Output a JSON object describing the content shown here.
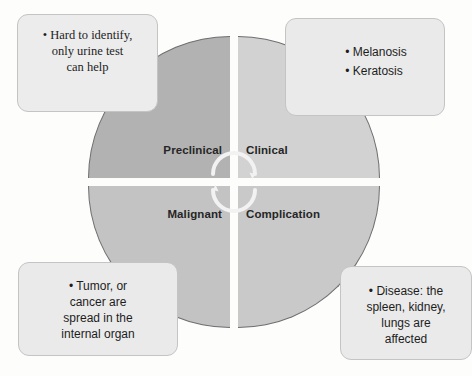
{
  "diagram": {
    "type": "four-quadrant-cycle",
    "title": "",
    "center_icon": "cycle-arrows-icon",
    "quadrants": [
      {
        "id": "preclinical",
        "label": "Preclinical",
        "position": "top-left",
        "fill": "#b2b2b2"
      },
      {
        "id": "clinical",
        "label": "Clinical",
        "position": "top-right",
        "fill": "#d2d2d2"
      },
      {
        "id": "malignant",
        "label": "Malignant",
        "position": "bottom-left",
        "fill": "#c3c3c3"
      },
      {
        "id": "complication",
        "label": "Complication",
        "position": "bottom-right",
        "fill": "#c9c9c9"
      }
    ],
    "callouts": [
      {
        "id": "preclinical-callout",
        "position": "top-left",
        "bullet": "•",
        "lines": [
          "• Hard to identify,",
          "only urine test",
          "can help"
        ],
        "text": "Hard to identify, only urine test can help"
      },
      {
        "id": "clinical-callout",
        "position": "top-right",
        "bullet": "•",
        "lines": [
          "• Melanosis",
          "• Keratosis"
        ],
        "items": [
          "Melanosis",
          "Keratosis"
        ],
        "text": "Melanosis Keratosis"
      },
      {
        "id": "malignant-callout",
        "position": "bottom-left",
        "bullet": "•",
        "lines": [
          "• Tumor, or",
          "cancer are",
          "spread in the",
          "internal organ"
        ],
        "text": "Tumor, or cancer are spread in the internal organ"
      },
      {
        "id": "complication-callout",
        "position": "bottom-right",
        "bullet": "•",
        "lines": [
          "• Disease: the",
          "spleen, kidney,",
          "lungs are",
          "affected"
        ],
        "text": "Disease: the spleen, kidney, lungs are affected"
      }
    ],
    "colors": {
      "background": "#fdfdfc",
      "box_fill": "#eaeaea",
      "box_border": "#c4c4c4",
      "outline": "#6e6e6e",
      "label_text": "#262626"
    }
  }
}
